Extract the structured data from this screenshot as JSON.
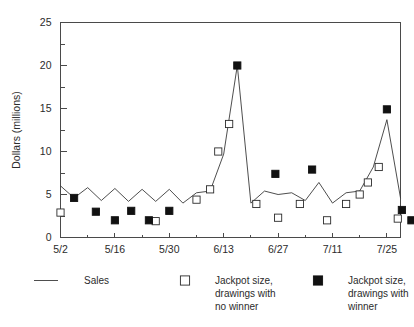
{
  "chart_data": {
    "type": "line",
    "title": "",
    "xlabel": "",
    "ylabel": "Dollars (millions)",
    "ylim": [
      0,
      25
    ],
    "yticks": [
      0,
      5,
      10,
      15,
      20,
      25
    ],
    "ytick_labels": [
      "0",
      "5",
      "10",
      "15",
      "20",
      "25"
    ],
    "yminor_step": 2.5,
    "grid": false,
    "legend_position": "below",
    "x_tick_labels": [
      "5/2",
      "5/16",
      "5/30",
      "6/13",
      "6/27",
      "7/11",
      "7/25"
    ],
    "x_tick_indices": [
      0,
      4,
      8,
      12,
      16,
      20,
      24
    ],
    "x_index_count": 26,
    "series": [
      {
        "name": "Sales",
        "type": "line",
        "marker": "none",
        "color": "#3a3a3a",
        "x": [
          0,
          1,
          2,
          3,
          4,
          5,
          6,
          7,
          8,
          9,
          10,
          11,
          12,
          13,
          14,
          15,
          16,
          17,
          18,
          19,
          20,
          21,
          22,
          23,
          24,
          25
        ],
        "values": [
          6.0,
          4.6,
          5.8,
          4.3,
          5.7,
          4.2,
          5.6,
          4.2,
          5.6,
          4.0,
          5.2,
          5.4,
          9.7,
          20.0,
          4.0,
          5.4,
          5.0,
          5.2,
          4.3,
          6.4,
          4.0,
          5.2,
          5.4,
          8.2,
          13.7,
          4.6
        ]
      },
      {
        "name": "Jackpot size, drawings with no winner",
        "type": "scatter",
        "marker": "open-square",
        "color": "#ffffff",
        "points": [
          {
            "x": 0,
            "y": 2.9
          },
          {
            "x": 7,
            "y": 1.9
          },
          {
            "x": 10,
            "y": 4.4
          },
          {
            "x": 11,
            "y": 5.6
          },
          {
            "x": 11.6,
            "y": 10.0
          },
          {
            "x": 12.4,
            "y": 13.2
          },
          {
            "x": 14.4,
            "y": 3.9
          },
          {
            "x": 16,
            "y": 2.3
          },
          {
            "x": 17.6,
            "y": 3.9
          },
          {
            "x": 19.6,
            "y": 2.0
          },
          {
            "x": 21,
            "y": 3.9
          },
          {
            "x": 22,
            "y": 5.0
          },
          {
            "x": 22.6,
            "y": 6.4
          },
          {
            "x": 23.4,
            "y": 8.2
          },
          {
            "x": 24.8,
            "y": 2.2
          }
        ]
      },
      {
        "name": "Jackpot size, drawings with winner",
        "type": "scatter",
        "marker": "filled-square",
        "color": "#111111",
        "points": [
          {
            "x": 1,
            "y": 4.6
          },
          {
            "x": 2.6,
            "y": 3.0
          },
          {
            "x": 4,
            "y": 2.0
          },
          {
            "x": 5.2,
            "y": 3.1
          },
          {
            "x": 6.5,
            "y": 2.0
          },
          {
            "x": 8,
            "y": 3.1
          },
          {
            "x": 13,
            "y": 20.0
          },
          {
            "x": 15.8,
            "y": 7.4
          },
          {
            "x": 18.5,
            "y": 7.9
          },
          {
            "x": 24,
            "y": 14.9
          },
          {
            "x": 25.1,
            "y": 3.2
          },
          {
            "x": 25.8,
            "y": 2.0
          }
        ]
      }
    ],
    "legend": [
      {
        "label_lines": [
          "Sales"
        ],
        "marker": "line"
      },
      {
        "label_lines": [
          "Jackpot size,",
          "drawings with",
          "no winner"
        ],
        "marker": "open-square"
      },
      {
        "label_lines": [
          "Jackpot size,",
          "drawings with",
          "winner"
        ],
        "marker": "filled-square"
      }
    ]
  },
  "legend_labels": {
    "sales": "Sales",
    "no_winner_l1": "Jackpot size,",
    "no_winner_l2": "drawings with",
    "no_winner_l3": "no winner",
    "winner_l1": "Jackpot size,",
    "winner_l2": "drawings with",
    "winner_l3": "winner"
  },
  "colors": {
    "axis": "#4a4a4a",
    "line": "#3a3a3a",
    "marker_fill": "#111111",
    "marker_open": "#ffffff",
    "text": "#2b2b2b",
    "background": "#ffffff"
  }
}
